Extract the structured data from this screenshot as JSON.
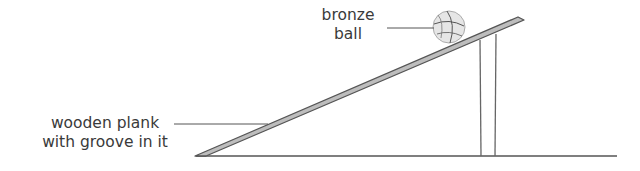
{
  "diagram": {
    "labels": {
      "ball_line1": "bronze",
      "ball_line2": "ball",
      "plank_line1": "wooden plank",
      "plank_line2": "with groove in it"
    },
    "colors": {
      "line": "#555555",
      "plank_fill": "#bdbdbd",
      "ball_fill": "#e6e6e6",
      "text": "#3a3a3a"
    }
  }
}
